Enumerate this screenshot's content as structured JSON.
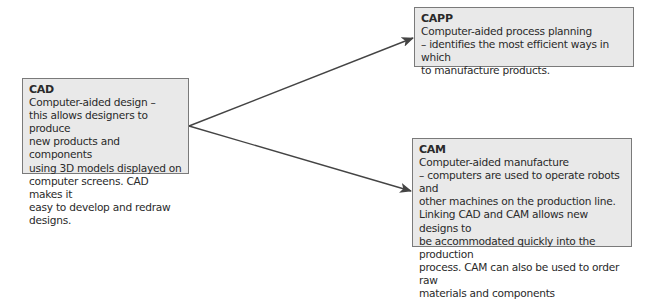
{
  "diagram": {
    "nodes": {
      "cad": {
        "title": "CAD",
        "body": "Computer-aided design –\nthis allows designers to produce\nnew products and components\nusing 3D models displayed on\ncomputer screens. CAD makes it\neasy to develop and redraw designs."
      },
      "capp": {
        "title": "CAPP",
        "body": "Computer-aided process planning\n– identifies the most efficient ways in which\nto manufacture products."
      },
      "cam": {
        "title": "CAM",
        "body": "Computer-aided manufacture\n– computers are used to operate robots and\nother machines on the production line.\nLinking CAD and CAM allows new designs to\nbe accommodated quickly into the production\nprocess. CAM can also be used to order raw\nmaterials and components"
      }
    },
    "edges": [
      {
        "from": "CAD",
        "to": "CAPP"
      },
      {
        "from": "CAD",
        "to": "CAM"
      }
    ],
    "colors": {
      "box_fill": "#e9e9e9",
      "box_border": "#7a7a7a",
      "arrow": "#444444"
    }
  }
}
